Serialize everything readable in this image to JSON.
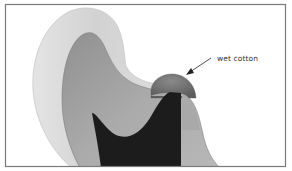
{
  "figure": {
    "annotations": [
      {
        "id": "wet-cotton",
        "text": "wet cotton"
      }
    ],
    "colors": {
      "frame": "#7a7a7a",
      "enamel": "#d9d9d9",
      "dentin": "#a0a0a0",
      "pulp": "#1c1c1c",
      "cotton": "#7b7b7b",
      "arrow": "#222222"
    }
  }
}
